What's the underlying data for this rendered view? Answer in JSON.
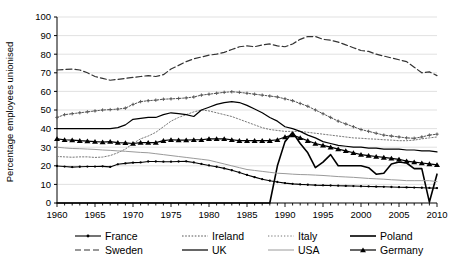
{
  "chart_data": {
    "type": "line",
    "title": "",
    "xlabel": "",
    "ylabel": "Percentage employees unionised",
    "xlim": [
      1960,
      2010
    ],
    "ylim": [
      0,
      100
    ],
    "ytick_step": 10,
    "xtick_step": 5,
    "grid": true,
    "grid_axis": "y",
    "legend_position": "bottom",
    "legend_columns": 4,
    "x_tick_labels": [
      "1960",
      "1965",
      "1970",
      "1975",
      "1980",
      "1985",
      "1990",
      "1995",
      "2000",
      "2005",
      "2010"
    ],
    "y_tick_labels": [
      "0",
      "10",
      "20",
      "30",
      "40",
      "50",
      "60",
      "70",
      "80",
      "90",
      "100"
    ],
    "x": [
      1960,
      1961,
      1962,
      1963,
      1964,
      1965,
      1966,
      1967,
      1968,
      1969,
      1970,
      1971,
      1972,
      1973,
      1974,
      1975,
      1976,
      1977,
      1978,
      1979,
      1980,
      1981,
      1982,
      1983,
      1984,
      1985,
      1986,
      1987,
      1988,
      1989,
      1990,
      1991,
      1992,
      1993,
      1994,
      1995,
      1996,
      1997,
      1998,
      1999,
      2000,
      2001,
      2002,
      2003,
      2004,
      2005,
      2006,
      2007,
      2008,
      2009,
      2010
    ],
    "series": [
      {
        "name": "France",
        "style": "solid-dot-marker",
        "color": "#000000",
        "width": 1.1,
        "marker": "dot",
        "values": [
          19.9,
          19.6,
          19.3,
          19.5,
          19.6,
          19.6,
          19.7,
          19.4,
          20.8,
          21.3,
          21.7,
          21.8,
          22.3,
          22.3,
          22.2,
          22.2,
          22.3,
          22.4,
          21.8,
          21.0,
          20.2,
          19.5,
          18.6,
          17.6,
          16.4,
          15.1,
          13.9,
          12.8,
          12.0,
          11.3,
          10.7,
          10.3,
          10.0,
          9.8,
          9.6,
          9.5,
          9.4,
          9.3,
          9.2,
          9.1,
          9.0,
          8.9,
          8.8,
          8.7,
          8.6,
          8.5,
          8.4,
          8.3,
          8.2,
          8.1,
          8.0
        ]
      },
      {
        "name": "Ireland",
        "style": "dotted-cross",
        "color": "#555555",
        "width": 1.0,
        "marker": "cross",
        "values": [
          46.0,
          47.5,
          48.0,
          48.5,
          49.0,
          49.5,
          50.0,
          50.2,
          50.5,
          51.0,
          53.0,
          54.5,
          55.0,
          55.3,
          55.8,
          56.0,
          56.2,
          56.5,
          57.0,
          58.0,
          58.5,
          59.0,
          59.5,
          59.8,
          59.5,
          59.0,
          58.5,
          58.0,
          57.5,
          57.0,
          56.0,
          55.0,
          53.5,
          52.0,
          50.0,
          48.0,
          46.0,
          44.0,
          42.5,
          41.0,
          39.5,
          38.5,
          37.5,
          36.5,
          36.0,
          35.5,
          35.0,
          34.8,
          35.5,
          36.5,
          37.0
        ]
      },
      {
        "name": "Italy",
        "style": "dotted-fine",
        "color": "#777777",
        "width": 1.0,
        "marker": "none",
        "values": [
          25.0,
          24.8,
          24.6,
          24.8,
          24.8,
          24.5,
          24.7,
          25.5,
          27.0,
          29.0,
          32.0,
          34.5,
          36.0,
          38.0,
          41.0,
          44.0,
          46.0,
          47.5,
          49.0,
          50.0,
          49.5,
          48.5,
          47.5,
          46.5,
          45.0,
          43.5,
          42.0,
          40.5,
          39.5,
          39.0,
          38.5,
          38.5,
          38.5,
          38.0,
          37.5,
          37.0,
          36.5,
          36.0,
          35.5,
          35.0,
          34.8,
          34.5,
          34.3,
          34.0,
          33.8,
          33.5,
          33.5,
          33.8,
          34.5,
          35.0,
          35.5
        ]
      },
      {
        "name": "Poland",
        "style": "solid-thick",
        "color": "#000000",
        "width": 1.6,
        "marker": "none",
        "values": [
          0,
          0,
          0,
          0,
          0,
          0,
          0,
          0,
          0,
          0,
          0,
          0,
          0,
          0,
          0,
          0,
          0,
          0,
          0,
          0,
          0,
          0,
          0,
          0,
          0,
          0,
          0,
          0,
          0,
          20.0,
          33.0,
          38.0,
          32.0,
          27.0,
          19.0,
          22.0,
          26.0,
          20.0,
          20.0,
          20.0,
          20.0,
          19.0,
          15.5,
          16.0,
          21.0,
          22.0,
          21.5,
          18.5,
          18.5,
          0.5,
          15.5
        ]
      },
      {
        "name": "Sweden",
        "style": "dashed",
        "color": "#333333",
        "width": 1.2,
        "marker": "none",
        "values": [
          71.5,
          71.8,
          72.0,
          71.5,
          70.0,
          68.0,
          67.0,
          66.0,
          66.5,
          67.0,
          67.5,
          68.0,
          68.5,
          68.0,
          69.0,
          72.0,
          74.0,
          76.0,
          77.5,
          78.5,
          79.5,
          80.0,
          81.0,
          82.5,
          84.0,
          84.5,
          84.0,
          85.0,
          85.5,
          84.5,
          84.0,
          85.5,
          88.0,
          89.5,
          89.5,
          88.0,
          87.5,
          86.5,
          85.0,
          83.5,
          82.0,
          81.5,
          80.0,
          79.0,
          78.0,
          77.0,
          76.0,
          73.0,
          70.0,
          70.5,
          68.5
        ]
      },
      {
        "name": "UK",
        "style": "solid",
        "color": "#000000",
        "width": 1.2,
        "marker": "none",
        "values": [
          40.0,
          40.0,
          40.0,
          40.0,
          40.0,
          40.0,
          40.0,
          40.0,
          40.5,
          42.0,
          45.0,
          45.5,
          46.0,
          46.0,
          47.5,
          48.5,
          48.0,
          47.5,
          46.5,
          50.0,
          51.5,
          53.0,
          54.0,
          54.5,
          54.0,
          52.5,
          50.5,
          48.5,
          46.0,
          44.0,
          41.0,
          40.0,
          38.5,
          36.5,
          35.0,
          33.0,
          32.0,
          31.0,
          30.5,
          30.0,
          30.0,
          29.5,
          29.5,
          29.0,
          29.0,
          29.0,
          28.5,
          28.5,
          28.0,
          28.0,
          27.5
        ]
      },
      {
        "name": "USA",
        "style": "solid-light",
        "color": "#9a9a9a",
        "width": 1.0,
        "marker": "none",
        "values": [
          30.0,
          29.6,
          29.3,
          29.2,
          29.0,
          28.8,
          28.5,
          28.3,
          28.0,
          27.8,
          27.5,
          27.2,
          27.0,
          26.5,
          26.0,
          25.5,
          25.0,
          24.5,
          24.0,
          23.5,
          23.0,
          22.0,
          21.0,
          20.0,
          19.0,
          18.0,
          17.5,
          17.0,
          16.5,
          16.0,
          15.8,
          15.5,
          15.3,
          15.2,
          15.0,
          14.8,
          14.5,
          14.2,
          14.0,
          13.8,
          13.5,
          13.2,
          13.0,
          12.8,
          12.5,
          12.3,
          12.0,
          12.0,
          12.0,
          12.0,
          11.5
        ]
      },
      {
        "name": "Germany",
        "style": "solid-triangle-marker",
        "color": "#000000",
        "width": 1.2,
        "marker": "triangle",
        "values": [
          34.5,
          34.0,
          33.8,
          33.5,
          33.3,
          33.0,
          32.8,
          33.0,
          32.5,
          32.3,
          32.0,
          32.5,
          32.5,
          32.5,
          33.5,
          34.0,
          33.8,
          33.8,
          34.0,
          34.0,
          34.5,
          34.5,
          34.5,
          34.0,
          33.5,
          33.5,
          33.5,
          33.5,
          33.5,
          34.0,
          35.5,
          36.5,
          35.0,
          33.5,
          32.0,
          31.0,
          30.0,
          29.0,
          28.0,
          27.0,
          26.0,
          25.5,
          25.0,
          24.5,
          24.0,
          23.5,
          22.5,
          22.0,
          21.5,
          21.0,
          20.5
        ]
      }
    ]
  },
  "legend": {
    "items": [
      {
        "label": "France",
        "series": "France"
      },
      {
        "label": "Ireland",
        "series": "Ireland"
      },
      {
        "label": "Italy",
        "series": "Italy"
      },
      {
        "label": "Poland",
        "series": "Poland"
      },
      {
        "label": "Sweden",
        "series": "Sweden"
      },
      {
        "label": "UK",
        "series": "UK"
      },
      {
        "label": "USA",
        "series": "USA"
      },
      {
        "label": "Germany",
        "series": "Germany"
      }
    ]
  }
}
